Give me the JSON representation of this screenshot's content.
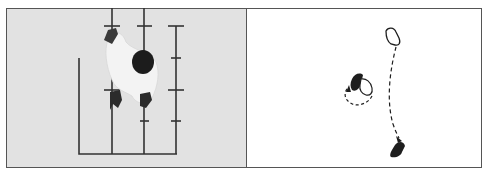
{
  "figure": {
    "panels": [
      {
        "id": "left",
        "kind": "photograph",
        "description": "Top-down photo of a child crawling/stepping across a floor grid of taped lines",
        "background": "#e2e2e2"
      },
      {
        "id": "right",
        "kind": "diagram",
        "description": "Footprint diagram showing foot placements with dashed movement arrows",
        "background": "#ffffff"
      }
    ],
    "colors": {
      "line": "#333333",
      "figure_dark": "#1e1e1e",
      "clothing": "#f2f2f2",
      "border": "#555555"
    }
  }
}
